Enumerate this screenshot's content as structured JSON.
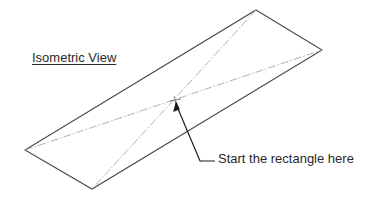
{
  "diagram": {
    "title": "Isometric View",
    "callout_text": "Start the rectangle here",
    "colors": {
      "outline": "#4a4a4a",
      "centerline": "#a8a8a8",
      "arrow": "#1a1a1a",
      "text": "#2a2a2a"
    },
    "shape": {
      "type": "isometric-rectangle",
      "corners": {
        "top": [
          256,
          10
        ],
        "right": [
          322,
          50
        ],
        "bottom": [
          92,
          189
        ],
        "left": [
          25,
          150
        ]
      },
      "diagonals": "dash-dot centerlines between opposite corners",
      "start_point": [
        175,
        100
      ]
    },
    "leader": {
      "points": [
        [
          176,
          102
        ],
        [
          200,
          161
        ],
        [
          215,
          161
        ]
      ],
      "arrowhead_at": "start_point"
    }
  }
}
